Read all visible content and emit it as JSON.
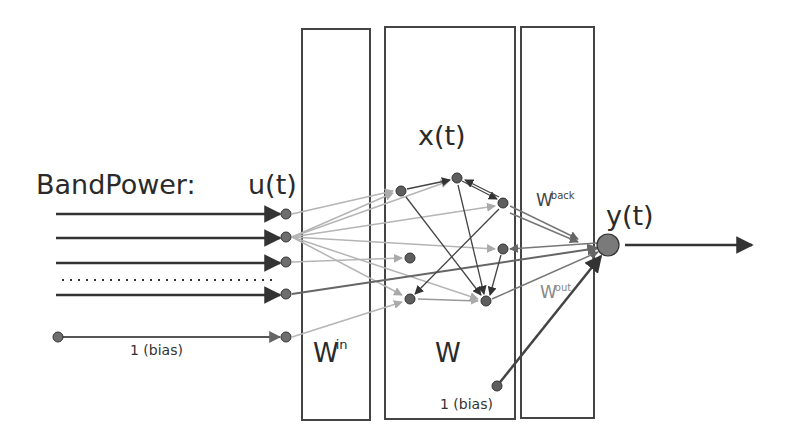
{
  "title_input": "BandPower:",
  "labels": {
    "input": "u(t)",
    "reservoir_state": "x(t)",
    "output": "y(t)",
    "input_bias": "1 (bias)",
    "reservoir_bias": "1 (bias)",
    "w_in": {
      "base": "W",
      "sup": "in"
    },
    "w": {
      "base": "W"
    },
    "w_back": {
      "base": "W",
      "sup": "back"
    },
    "w_out": {
      "base": "W",
      "sup": "out"
    }
  },
  "colors": {
    "stroke_dark": "#333333",
    "stroke_gray": "#777777",
    "stroke_light": "#b5b5b5",
    "node_fill": "#6e6e6e",
    "box_stroke": "#444444"
  },
  "boxes": [
    {
      "id": "win-box",
      "x": 302,
      "y": 29,
      "w": 68,
      "h": 391
    },
    {
      "id": "w-box",
      "x": 385,
      "y": 27,
      "w": 130,
      "h": 392
    },
    {
      "id": "wout-box",
      "x": 521,
      "y": 27,
      "w": 73,
      "h": 391
    }
  ],
  "input_nodes": [
    {
      "x": 286,
      "y": 214
    },
    {
      "x": 286,
      "y": 237
    },
    {
      "x": 286,
      "y": 262
    },
    {
      "x": 286,
      "y": 294
    },
    {
      "x": 286,
      "y": 337
    }
  ],
  "reservoir_nodes": [
    {
      "x": 401,
      "y": 191
    },
    {
      "x": 457,
      "y": 178
    },
    {
      "x": 503,
      "y": 203
    },
    {
      "x": 503,
      "y": 249
    },
    {
      "x": 410,
      "y": 258
    },
    {
      "x": 410,
      "y": 299
    },
    {
      "x": 486,
      "y": 301
    }
  ],
  "output_node": {
    "x": 608,
    "y": 245,
    "r": 11
  },
  "bias_nodes": {
    "input_bias": {
      "x": 58,
      "y": 337
    },
    "reservoir_bias": {
      "x": 497,
      "y": 386
    }
  }
}
